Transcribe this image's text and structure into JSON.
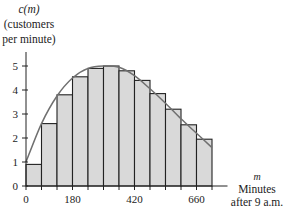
{
  "chart_data": {
    "type": "bar",
    "title": "",
    "ylabel_lines": [
      "c(m)",
      "(customers",
      "per minute)"
    ],
    "xlabel_lines": [
      "m",
      "Minutes",
      "after 9 a.m."
    ],
    "x_bin_edges": [
      0,
      60,
      120,
      180,
      240,
      300,
      360,
      420,
      480,
      540,
      600,
      660,
      720
    ],
    "categories": [
      "0-60",
      "60-120",
      "120-180",
      "180-240",
      "240-300",
      "300-360",
      "360-420",
      "420-480",
      "480-540",
      "540-600",
      "600-660",
      "660-720"
    ],
    "values": [
      0.9,
      2.6,
      3.8,
      4.55,
      4.9,
      5.0,
      4.8,
      4.4,
      3.85,
      3.2,
      2.55,
      1.95
    ],
    "curve": {
      "description": "smooth curve c(m) passing through left... rising from ~1 at m=0 to max ~5 near m=330, falling to ~1.6 at m=720",
      "points": [
        [
          0,
          1.0
        ],
        [
          60,
          2.6
        ],
        [
          120,
          3.75
        ],
        [
          180,
          4.5
        ],
        [
          240,
          4.9
        ],
        [
          300,
          5.0
        ],
        [
          360,
          4.95
        ],
        [
          420,
          4.6
        ],
        [
          480,
          4.05
        ],
        [
          540,
          3.45
        ],
        [
          600,
          2.8
        ],
        [
          660,
          2.2
        ],
        [
          720,
          1.6
        ]
      ]
    },
    "x_ticks": [
      0,
      180,
      420,
      660
    ],
    "y_ticks": [
      0,
      1,
      2,
      3,
      4,
      5
    ],
    "xlim": [
      0,
      780
    ],
    "ylim": [
      0,
      5.8
    ],
    "grid": false,
    "legend": null,
    "colors": {
      "bar_fill": "#d9d9d9",
      "bar_edge": "#222222",
      "curve": "#707070",
      "axis": "#222222"
    }
  },
  "labels": {
    "y1": "c(m)",
    "y2": "(customers",
    "y3": "per minute)",
    "x1": "m",
    "x2": "Minutes",
    "x3": "after 9 a.m."
  }
}
